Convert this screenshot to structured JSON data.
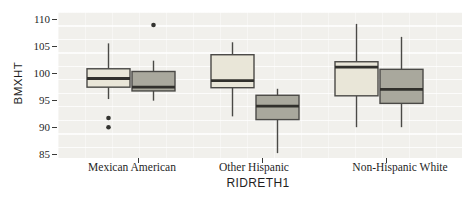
{
  "figure": {
    "width": 474,
    "height": 198,
    "background": "#ffffff"
  },
  "chart_data": {
    "type": "boxplot",
    "title": "",
    "xlabel": "RIDRETH1",
    "ylabel": "BMXHT",
    "ylim": [
      84.3,
      111.3
    ],
    "yticks": [
      85,
      90,
      95,
      100,
      105,
      110
    ],
    "categories": [
      "Mexican American",
      "Other Hispanic",
      "Non-Hispanic White"
    ],
    "grid": "faint white grid on light gray panel",
    "legend_position": "none",
    "series": [
      {
        "name": "group-1-light",
        "fill": "#e9e6d8",
        "boxes": [
          {
            "low": 95.2,
            "q1": 97.4,
            "median": 99.0,
            "q3": 100.8,
            "high": 105.5,
            "outliers": [
              91.7,
              90.0
            ]
          },
          {
            "low": 92.0,
            "q1": 97.3,
            "median": 98.6,
            "q3": 103.4,
            "high": 105.7,
            "outliers": []
          },
          {
            "low": 90.0,
            "q1": 95.8,
            "median": 101.1,
            "q3": 102.1,
            "high": 109.1,
            "outliers": []
          }
        ]
      },
      {
        "name": "group-2-dark",
        "fill": "#a9a89d",
        "boxes": [
          {
            "low": 94.9,
            "q1": 96.7,
            "median": 97.4,
            "q3": 100.3,
            "high": 102.3,
            "outliers": [
              108.9
            ]
          },
          {
            "low": 85.2,
            "q1": 91.4,
            "median": 93.9,
            "q3": 95.9,
            "high": 97.1,
            "outliers": []
          },
          {
            "low": 90.0,
            "q1": 94.4,
            "median": 97.0,
            "q3": 100.7,
            "high": 106.7,
            "outliers": []
          }
        ]
      }
    ],
    "layout": {
      "panel": {
        "left": 58,
        "top": 12,
        "width": 404,
        "height": 146
      },
      "category_center_px": [
        73,
        197,
        321
      ],
      "box_offset_px": 22.5,
      "box_width_px": 43,
      "category_label_dx_px": [
        1,
        -1,
        21
      ],
      "panel_bg": "#f1f0ec",
      "stroke_color": "#4a4946",
      "median_color": "#31302c",
      "outlier_color": "#333330",
      "text_color": "#1f1f1f"
    }
  }
}
